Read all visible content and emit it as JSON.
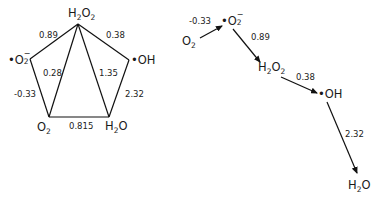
{
  "colors": {
    "line": "#111111",
    "text": "#1a1a1a",
    "background": "#ffffff"
  },
  "species": {
    "h2o2": {
      "base1": "H",
      "sub1": "2",
      "base2": "O",
      "sub2": "2"
    },
    "superoxide": {
      "dot": "•",
      "base": "O",
      "sub": "2",
      "sup": "−"
    },
    "hydroxyl": {
      "dot": "•",
      "text": "OH"
    },
    "o2": {
      "base": "O",
      "sub": "2"
    },
    "h2o": {
      "base1": "H",
      "sub1": "2",
      "base2": "O"
    }
  },
  "pentagon": {
    "edges": {
      "superoxide_h2o2": "0.89",
      "h2o2_hydroxyl": "0.38",
      "o2_h2o2": "0.28",
      "h2o2_h2o": "1.35",
      "o2_superoxide": "-0.33",
      "hydroxyl_h2o": "2.32",
      "o2_h2o": "0.815"
    }
  },
  "chain": {
    "steps": [
      {
        "from": "O2",
        "to": "•O2−",
        "value": "-0.33"
      },
      {
        "from": "•O2−",
        "to": "H2O2",
        "value": "0.89"
      },
      {
        "from": "H2O2",
        "to": "•OH",
        "value": "0.38"
      },
      {
        "from": "•OH",
        "to": "H2O",
        "value": "2.32"
      }
    ]
  }
}
